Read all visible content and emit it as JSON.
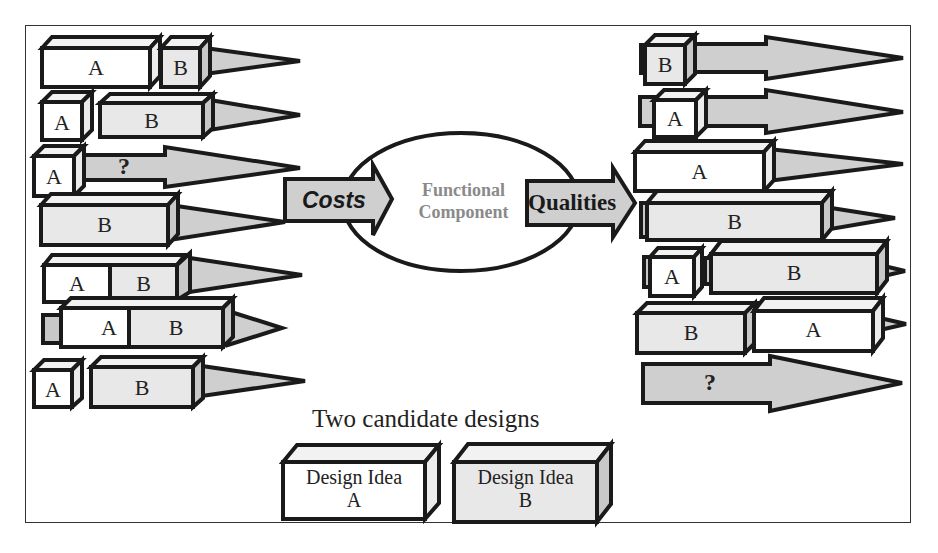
{
  "diagram": {
    "center": {
      "node_label_line1": "Functional",
      "node_label_line2": "Component",
      "input_arrow_label": "Costs",
      "output_arrow_label": "Qualities"
    },
    "left_cost_rows": [
      {
        "blocks": [
          "A",
          "B"
        ]
      },
      {
        "blocks": [
          "A",
          "B"
        ]
      },
      {
        "blocks": [
          "A"
        ],
        "arrow_label": "?"
      },
      {
        "blocks": [
          "B"
        ]
      },
      {
        "blocks": [
          "A",
          "B"
        ]
      },
      {
        "blocks": [
          "A",
          "B"
        ]
      },
      {
        "blocks": [
          "A",
          "B"
        ]
      }
    ],
    "right_quality_rows": [
      {
        "blocks": [
          "B"
        ]
      },
      {
        "blocks": [
          "A"
        ]
      },
      {
        "blocks": [
          "A"
        ]
      },
      {
        "blocks": [
          "B"
        ]
      },
      {
        "blocks": [
          "A",
          "B"
        ]
      },
      {
        "blocks": [
          "B",
          "A"
        ]
      },
      {
        "blocks": [],
        "arrow_label": "?"
      }
    ],
    "legend": {
      "title": "Two candidate designs",
      "design_a_line1": "Design Idea",
      "design_a_line2": "A",
      "design_b_line1": "Design Idea",
      "design_b_line2": "B"
    },
    "colors": {
      "design_a_fill": "#ffffff",
      "design_b_fill": "#e6e6e6",
      "arrow_fill": "#cfcfcf",
      "outline": "#1a1a1a",
      "functional_component_text": "#8a8a8a"
    }
  }
}
